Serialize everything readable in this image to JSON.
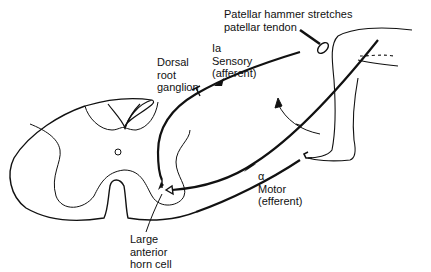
{
  "diagram": {
    "colors": {
      "line": "#111111",
      "background": "#ffffff"
    },
    "labels": {
      "hammer": {
        "line1": "Patellar hammer stretches",
        "line2": "patellar tendon"
      },
      "sensory": {
        "line1": "Ia",
        "line2": "Sensory",
        "line3": "(afferent)"
      },
      "drg": {
        "line1": "Dorsal",
        "line2": "root",
        "line3": "ganglion"
      },
      "motor": {
        "line1": "α",
        "line2": "Motor",
        "line3": "(efferent)"
      },
      "horn_cell": {
        "line1": "Large",
        "line2": "anterior",
        "line3": "horn cell"
      },
      "central_canal": "O"
    },
    "icons": {
      "spinal_cord": "spinal-cord-cross-section",
      "leg": "leg-outline",
      "hammer": "reflex-hammer",
      "kick_arrow": "curved-arrow",
      "neuron": "triangle-cell-body"
    }
  }
}
